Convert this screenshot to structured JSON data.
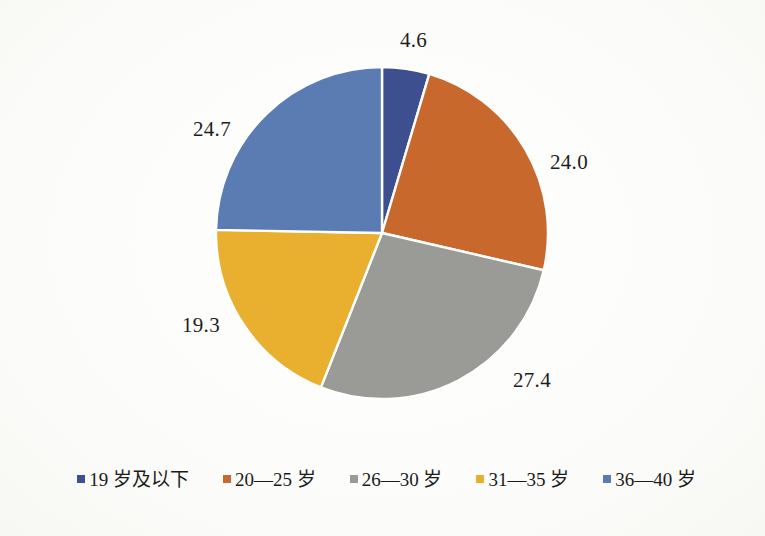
{
  "chart_data": {
    "type": "pie",
    "title": "",
    "subtitle": "",
    "xlabel": "",
    "ylabel": "",
    "grid": false,
    "legend_position": "bottom",
    "start_angle_deg": 0,
    "direction": "clockwise",
    "categories": [
      "19 岁及以下",
      "20—25 岁",
      "26—30 岁",
      "31—35 岁",
      "36—40 岁"
    ],
    "values": [
      4.6,
      24.0,
      27.4,
      19.3,
      24.7
    ],
    "value_labels": [
      "4.6",
      "24.0",
      "27.4",
      "19.3",
      "24.7"
    ],
    "colors": [
      "#3d4f8f",
      "#c8682d",
      "#9a9a97",
      "#e8b02e",
      "#5a7cb3"
    ],
    "total": 100.0,
    "slices": [
      {
        "label": "19 岁及以下",
        "value": 4.6,
        "value_label": "4.6",
        "color": "#3d4f8f"
      },
      {
        "label": "20—25 岁",
        "value": 24.0,
        "value_label": "24.0",
        "color": "#c8682d"
      },
      {
        "label": "26—30 岁",
        "value": 27.4,
        "value_label": "27.4",
        "color": "#9a9a97"
      },
      {
        "label": "31—35 岁",
        "value": 19.3,
        "value_label": "19.3",
        "color": "#e8b02e"
      },
      {
        "label": "36—40 岁",
        "value": 24.7,
        "value_label": "24.7",
        "color": "#5a7cb3"
      }
    ]
  },
  "legend": {
    "items": [
      {
        "label": "19 岁及以下",
        "color": "#3d4f8f"
      },
      {
        "label": "20—25 岁",
        "color": "#c8682d"
      },
      {
        "label": "26—30 岁",
        "color": "#9a9a97"
      },
      {
        "label": "31—35 岁",
        "color": "#e8b02e"
      },
      {
        "label": "36—40 岁",
        "color": "#5a7cb3"
      }
    ]
  },
  "style": {
    "background": "#fdfdfb",
    "slice_separator": "#ffffff",
    "label_color": "#1d1d1d"
  }
}
